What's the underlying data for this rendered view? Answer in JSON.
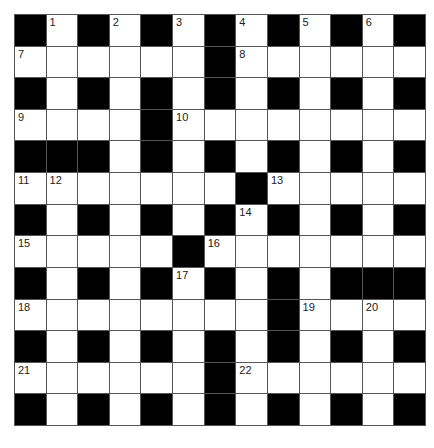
{
  "puzzle": {
    "size": 13,
    "rows": [
      "#.#.#.#.#.#.#",
      "......#......",
      "#.#.#.#.#.#.#",
      "....#........",
      "###.#.#.#.#.#",
      ".......#.....",
      "#.#.#.#.#.#.#",
      ".....#.......",
      "#.#.#.#.#.###",
      "........#....",
      "#.#.#.#.#.#.#",
      "......#......",
      "#.#.#.#.#.#.#"
    ],
    "numbers": [
      {
        "r": 0,
        "c": 1,
        "n": "1"
      },
      {
        "r": 0,
        "c": 3,
        "n": "2"
      },
      {
        "r": 0,
        "c": 5,
        "n": "3"
      },
      {
        "r": 0,
        "c": 7,
        "n": "4"
      },
      {
        "r": 0,
        "c": 9,
        "n": "5"
      },
      {
        "r": 0,
        "c": 11,
        "n": "6"
      },
      {
        "r": 1,
        "c": 0,
        "n": "7"
      },
      {
        "r": 1,
        "c": 7,
        "n": "8"
      },
      {
        "r": 3,
        "c": 0,
        "n": "9"
      },
      {
        "r": 3,
        "c": 5,
        "n": "10"
      },
      {
        "r": 5,
        "c": 0,
        "n": "11"
      },
      {
        "r": 5,
        "c": 1,
        "n": "12"
      },
      {
        "r": 5,
        "c": 8,
        "n": "13"
      },
      {
        "r": 6,
        "c": 7,
        "n": "14"
      },
      {
        "r": 7,
        "c": 0,
        "n": "15"
      },
      {
        "r": 7,
        "c": 6,
        "n": "16"
      },
      {
        "r": 8,
        "c": 5,
        "n": "17"
      },
      {
        "r": 9,
        "c": 0,
        "n": "18"
      },
      {
        "r": 9,
        "c": 9,
        "n": "19"
      },
      {
        "r": 9,
        "c": 11,
        "n": "20"
      },
      {
        "r": 11,
        "c": 0,
        "n": "21"
      },
      {
        "r": 11,
        "c": 7,
        "n": "22"
      }
    ]
  },
  "colors": {
    "block": "#000000",
    "cell": "#ffffff",
    "line": "#555555"
  }
}
